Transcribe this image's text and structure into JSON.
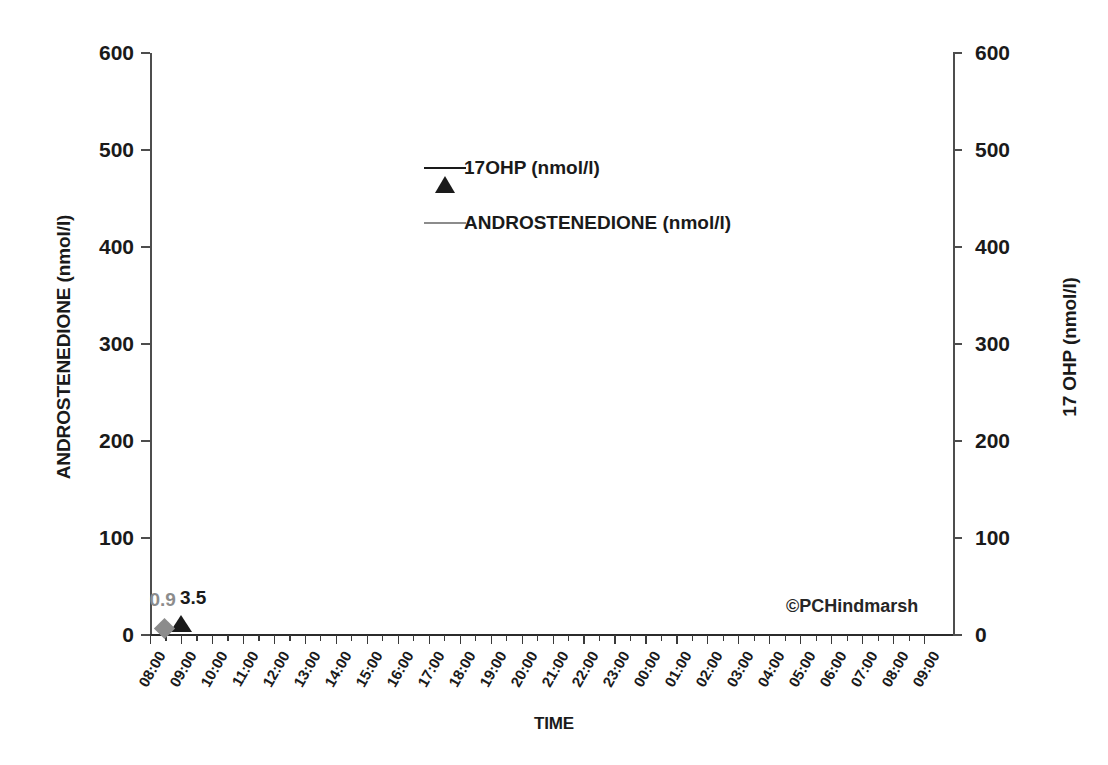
{
  "chart_data": {
    "type": "scatter",
    "title": "",
    "xlabel": "TIME",
    "ylabel": "ANDROSTENEDIONE (nmol/l)",
    "y2label": "17 OHP (nmol/l)",
    "ylim": [
      0,
      600
    ],
    "y2lim": [
      0,
      600
    ],
    "yticks": [
      0,
      100,
      200,
      300,
      400,
      500,
      600
    ],
    "y2ticks": [
      0,
      100,
      200,
      300,
      400,
      500,
      600
    ],
    "ytick_labels": [
      "0",
      "100",
      "200",
      "300",
      "400",
      "500",
      "600"
    ],
    "y2tick_labels": [
      "0",
      "100",
      "200",
      "300",
      "400",
      "500",
      "600"
    ],
    "grid": false,
    "legend_position": "upper-center",
    "x": [
      "08:00",
      "09:00",
      "10:00",
      "11:00",
      "12:00",
      "13:00",
      "14:00",
      "15:00",
      "16:00",
      "17:00",
      "18:00",
      "19:00",
      "20:00",
      "21:00",
      "22:00",
      "23:00",
      "00:00",
      "01:00",
      "02:00",
      "03:00",
      "04:00",
      "05:00",
      "06:00",
      "07:00",
      "08:00",
      "09:00"
    ],
    "xtick_labels": [
      "08:00",
      "09:00",
      "10:00",
      "11:00",
      "12:00",
      "13:00",
      "14:00",
      "15:00",
      "16:00",
      "17:00",
      "18:00",
      "19:00",
      "20:00",
      "21:00",
      "22:00",
      "23:00",
      "00:00",
      "01:00",
      "02:00",
      "03:00",
      "04:00",
      "05:00",
      "06:00",
      "07:00",
      "08:00",
      "09:00"
    ],
    "series": [
      {
        "name": "17OHP (nmol/l)",
        "axis": "right",
        "marker": "triangle",
        "color": "#1a1a1a",
        "points": [
          {
            "x": "09:00",
            "y": 3.5,
            "label": "3.5"
          }
        ]
      },
      {
        "name": "ANDROSTENEDIONE (nmol/l)",
        "axis": "left",
        "marker": "diamond",
        "color": "#8c8c8c",
        "points": [
          {
            "x": "08:30",
            "y": 0.9,
            "label": "0.9"
          }
        ]
      }
    ],
    "annotations": [
      {
        "text": "©PCHindmarsh",
        "x": "05:30",
        "y": 40
      }
    ]
  },
  "legend": {
    "items": [
      {
        "label": "17OHP (nmol/l)",
        "marker": "triangle",
        "color": "#1a1a1a"
      },
      {
        "label": "ANDROSTENEDIONE (nmol/l)",
        "marker": "diamond",
        "color": "#8c8c8c"
      }
    ]
  },
  "axes": {
    "left_title": "ANDROSTENEDIONE (nmol/l)",
    "right_title": "17 OHP (nmol/l)",
    "x_title": "TIME"
  },
  "credit": "©PCHindmarsh",
  "colors": {
    "series_17ohp": "#1a1a1a",
    "series_androstenedione": "#8c8c8c",
    "axis": "#4d4d4d",
    "text": "#1a1a1a",
    "background": "#ffffff"
  }
}
